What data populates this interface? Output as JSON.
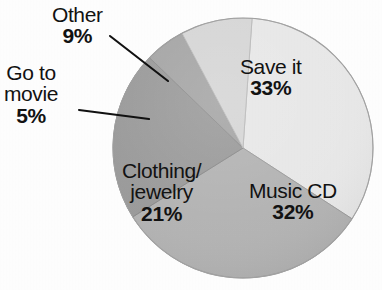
{
  "chart_data": {
    "type": "pie",
    "title": "",
    "subtitle": "",
    "xlabel": "",
    "ylabel": "",
    "legend_position": "none",
    "grid": false,
    "unit": "%",
    "categories": [
      "Save it",
      "Music CD",
      "Clothing/jewelry",
      "Go to movie",
      "Other"
    ],
    "values": [
      33,
      32,
      21,
      5,
      9
    ],
    "slices": [
      {
        "label": "Save it",
        "label_line1": "Save it",
        "label_line2": "",
        "value": 33,
        "value_text": "33%",
        "color": "#e9e9e9",
        "label_placement": "inside",
        "start_angle": 4,
        "end_angle": 123
      },
      {
        "label": "Music CD",
        "label_line1": "Music CD",
        "label_line2": "",
        "value": 32,
        "value_text": "32%",
        "color": "#b4b4b4",
        "label_placement": "inside",
        "start_angle": 123,
        "end_angle": 238
      },
      {
        "label": "Clothing/jewelry",
        "label_line1": "Clothing/",
        "label_line2": "jewelry",
        "value": 21,
        "value_text": "21%",
        "color": "#9b9b9b",
        "label_placement": "inside",
        "start_angle": 238,
        "end_angle": 314
      },
      {
        "label": "Go to movie",
        "label_line1": "Go to",
        "label_line2": "movie",
        "value": 5,
        "value_text": "5%",
        "color": "#a6a6a6",
        "label_placement": "outside",
        "start_angle": 314,
        "end_angle": 332
      },
      {
        "label": "Other",
        "label_line1": "Other",
        "label_line2": "",
        "value": 9,
        "value_text": "9%",
        "color": "#d7d7d7",
        "label_placement": "outside",
        "start_angle": 332,
        "end_angle": 364
      }
    ],
    "geometry": {
      "center_x": 243,
      "center_y": 148,
      "radius": 130
    }
  },
  "labels": {
    "save_it": {
      "name": "Save it",
      "pct": "33%"
    },
    "music_cd": {
      "name": "Music CD",
      "pct": "32%"
    },
    "clothing": {
      "name_line1": "Clothing/",
      "name_line2": "jewelry",
      "pct": "21%"
    },
    "go_to_movie": {
      "name_line1": "Go to",
      "name_line2": "movie",
      "pct": "5%"
    },
    "other": {
      "name": "Other",
      "pct": "9%"
    }
  },
  "colors": {
    "save_it": "#e9e9e9",
    "music_cd": "#b4b4b4",
    "clothing": "#9b9b9b",
    "go_to_movie": "#a6a6a6",
    "other": "#d7d7d7",
    "outline": "#8a8a8a",
    "leader_line": "#111111",
    "text": "#121212",
    "background": "#ffffff"
  }
}
